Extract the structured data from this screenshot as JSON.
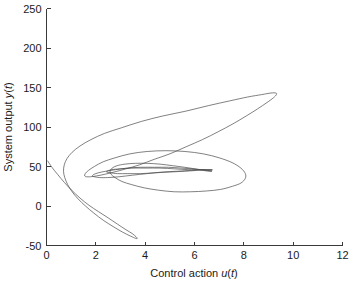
{
  "figure": {
    "background_color": "#ffffff",
    "axis_color": "#3a3a3a",
    "curve_color": "#4a4a4a"
  },
  "chart_data": {
    "type": "line",
    "title": "",
    "subtitle": "",
    "xlabel": "Control action u(t)",
    "xlabel_parts": {
      "plain1": "Control action ",
      "ital1": "u",
      "paren1": "(",
      "ital2": "t",
      "paren2": ")"
    },
    "ylabel": "System output y(t)",
    "ylabel_parts": {
      "plain1": "System output ",
      "ital1": "y",
      "paren1": "(",
      "ital2": "t",
      "paren2": ")"
    },
    "xlim": [
      0,
      12
    ],
    "ylim": [
      -50,
      250
    ],
    "xticks": [
      0,
      2,
      4,
      6,
      8,
      10,
      12
    ],
    "xtick_labels": [
      "0",
      "2",
      "4",
      "6",
      "8",
      "10",
      "12"
    ],
    "yticks": [
      -50,
      0,
      50,
      100,
      150,
      200,
      250
    ],
    "ytick_labels": [
      "-50",
      "0",
      "50",
      "100",
      "150",
      "200",
      "250"
    ],
    "grid": false,
    "legend": null,
    "legend_position": "none",
    "annotations": [],
    "series": [
      {
        "name": "phase trajectory",
        "color": "#4a4a4a",
        "linewidth": 0.7,
        "description": "Phase-plane trajectory of system output y(t) versus control action u(t); a multi-lobed spiral converging toward a central region.",
        "points": [
          [
            0.05,
            57
          ],
          [
            0.22,
            49
          ],
          [
            0.45,
            40
          ],
          [
            0.72,
            30
          ],
          [
            1.02,
            20
          ],
          [
            1.36,
            10
          ],
          [
            1.72,
            1
          ],
          [
            2.1,
            -7
          ],
          [
            2.5,
            -15
          ],
          [
            2.88,
            -23
          ],
          [
            3.22,
            -30
          ],
          [
            3.48,
            -35
          ],
          [
            3.63,
            -39
          ],
          [
            3.68,
            -41
          ],
          [
            3.62,
            -41
          ],
          [
            3.4,
            -38
          ],
          [
            3.08,
            -33
          ],
          [
            2.7,
            -26
          ],
          [
            2.3,
            -18
          ],
          [
            1.92,
            -9
          ],
          [
            1.58,
            0
          ],
          [
            1.28,
            9
          ],
          [
            1.04,
            18
          ],
          [
            0.86,
            27
          ],
          [
            0.74,
            36
          ],
          [
            0.69,
            44
          ],
          [
            0.72,
            52
          ],
          [
            0.83,
            60
          ],
          [
            1.04,
            68
          ],
          [
            1.36,
            76
          ],
          [
            1.8,
            84
          ],
          [
            2.36,
            92
          ],
          [
            3.04,
            99
          ],
          [
            3.84,
            107
          ],
          [
            4.72,
            114
          ],
          [
            5.64,
            120
          ],
          [
            6.56,
            127
          ],
          [
            7.42,
            133
          ],
          [
            8.16,
            138
          ],
          [
            8.72,
            141
          ],
          [
            9.1,
            143
          ],
          [
            9.3,
            143
          ],
          [
            9.32,
            141
          ],
          [
            9.2,
            137
          ],
          [
            8.94,
            131
          ],
          [
            8.56,
            123
          ],
          [
            8.1,
            114
          ],
          [
            7.56,
            104
          ],
          [
            6.96,
            94
          ],
          [
            6.32,
            84
          ],
          [
            5.66,
            75
          ],
          [
            5.0,
            66
          ],
          [
            4.36,
            59
          ],
          [
            3.76,
            52
          ],
          [
            3.22,
            47
          ],
          [
            2.74,
            43
          ],
          [
            2.34,
            40
          ],
          [
            2.02,
            38
          ],
          [
            1.78,
            37
          ],
          [
            1.62,
            37
          ],
          [
            1.55,
            38
          ],
          [
            1.57,
            41
          ],
          [
            1.7,
            45
          ],
          [
            1.94,
            50
          ],
          [
            2.3,
            56
          ],
          [
            2.78,
            61
          ],
          [
            3.38,
            66
          ],
          [
            4.08,
            69
          ],
          [
            4.84,
            70
          ],
          [
            5.62,
            69
          ],
          [
            6.36,
            66
          ],
          [
            7.0,
            61
          ],
          [
            7.52,
            55
          ],
          [
            7.88,
            48
          ],
          [
            8.06,
            41
          ],
          [
            8.06,
            35
          ],
          [
            7.88,
            29
          ],
          [
            7.54,
            25
          ],
          [
            7.06,
            21
          ],
          [
            6.48,
            19
          ],
          [
            5.84,
            18
          ],
          [
            5.18,
            18
          ],
          [
            4.54,
            20
          ],
          [
            3.96,
            23
          ],
          [
            3.46,
            27
          ],
          [
            3.06,
            31
          ],
          [
            2.78,
            36
          ],
          [
            2.62,
            40
          ],
          [
            2.58,
            44
          ],
          [
            2.66,
            48
          ],
          [
            2.86,
            51
          ],
          [
            3.18,
            53
          ],
          [
            3.6,
            54
          ],
          [
            4.08,
            54
          ],
          [
            4.6,
            53
          ],
          [
            5.12,
            51
          ],
          [
            5.6,
            49
          ],
          [
            6.02,
            47
          ],
          [
            6.36,
            45
          ],
          [
            6.58,
            44
          ],
          [
            6.7,
            44
          ],
          [
            6.68,
            44
          ],
          [
            6.54,
            45
          ],
          [
            6.28,
            46
          ],
          [
            5.92,
            47
          ],
          [
            5.46,
            48
          ],
          [
            4.94,
            49
          ],
          [
            4.38,
            49
          ],
          [
            3.82,
            49
          ],
          [
            3.28,
            48
          ],
          [
            2.8,
            46
          ],
          [
            2.4,
            44
          ],
          [
            2.1,
            42
          ],
          [
            1.92,
            40
          ],
          [
            1.86,
            38
          ],
          [
            1.94,
            37
          ],
          [
            2.14,
            36
          ],
          [
            2.48,
            36
          ],
          [
            2.94,
            37
          ],
          [
            3.48,
            39
          ],
          [
            4.08,
            41
          ],
          [
            4.7,
            43
          ],
          [
            5.3,
            44
          ],
          [
            5.84,
            45
          ],
          [
            6.28,
            46
          ],
          [
            6.58,
            46
          ],
          [
            6.72,
            46
          ],
          [
            6.68,
            46
          ],
          [
            6.46,
            46
          ],
          [
            6.08,
            45
          ],
          [
            5.58,
            44
          ],
          [
            5.0,
            43
          ],
          [
            4.4,
            42
          ],
          [
            3.82,
            41
          ],
          [
            3.3,
            41
          ],
          [
            2.88,
            41
          ],
          [
            2.58,
            42
          ],
          [
            2.44,
            43
          ],
          [
            2.46,
            44
          ],
          [
            2.64,
            46
          ],
          [
            2.98,
            47
          ],
          [
            3.44,
            48
          ],
          [
            4.0,
            48
          ],
          [
            4.6,
            48
          ],
          [
            5.2,
            47
          ],
          [
            5.76,
            46
          ],
          [
            6.22,
            46
          ],
          [
            6.54,
            45
          ],
          [
            6.7,
            45
          ]
        ]
      }
    ]
  }
}
